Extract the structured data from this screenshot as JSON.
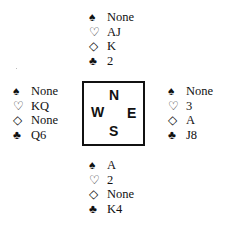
{
  "suits": {
    "spades": "♠",
    "hearts": "♡",
    "diamonds": "◇",
    "clubs": "♣"
  },
  "hands": {
    "north": {
      "spades": "None",
      "hearts": "AJ",
      "diamonds": "K",
      "clubs": "2"
    },
    "west": {
      "spades": "None",
      "hearts": "KQ",
      "diamonds": "None",
      "clubs": "Q6"
    },
    "east": {
      "spades": "None",
      "hearts": "3",
      "diamonds": "A",
      "clubs": "J8"
    },
    "south": {
      "spades": "A",
      "hearts": "2",
      "diamonds": "None",
      "clubs": "K4"
    }
  },
  "compass": {
    "n": "N",
    "w": "W",
    "e": "E",
    "s": "S"
  }
}
